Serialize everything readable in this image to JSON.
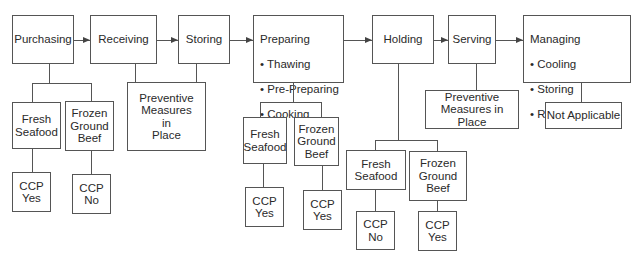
{
  "diagram": {
    "type": "flowchart",
    "steps": [
      {
        "id": "purchasing",
        "label": "Purchasing"
      },
      {
        "id": "receiving",
        "label": "Receiving"
      },
      {
        "id": "storing",
        "label": "Storing"
      },
      {
        "id": "preparing",
        "label": "Preparing",
        "bullets": [
          "Thawing",
          "Pre-Preparing",
          "Cooking"
        ]
      },
      {
        "id": "holding",
        "label": "Holding"
      },
      {
        "id": "serving",
        "label": "Serving"
      },
      {
        "id": "managing",
        "label": "Managing",
        "bullets": [
          "Cooling",
          "Storing",
          "Re-heating"
        ]
      }
    ],
    "branches": {
      "purchasing": {
        "fresh": "Fresh\nSeafood",
        "frozen": "Frozen\nGround\nBeef",
        "fresh_ccp": "CCP\nYes",
        "frozen_ccp": "CCP\nNo"
      },
      "receiving_storing": {
        "note": "Preventive\nMeasures\nin\nPlace"
      },
      "preparing": {
        "fresh": "Fresh\nSeafood",
        "frozen": "Frozen\nGround\nBeef",
        "fresh_ccp": "CCP\nYes",
        "frozen_ccp": "CCP\nYes"
      },
      "holding": {
        "fresh": "Fresh\nSeafood",
        "frozen": "Frozen\nGround\nBeef",
        "fresh_ccp": "CCP\nNo",
        "frozen_ccp": "CCP\nYes"
      },
      "serving": {
        "note": "Preventive\nMeasures in Place"
      },
      "managing": {
        "note": "Not Applicable"
      }
    },
    "bullet_char": "•"
  }
}
